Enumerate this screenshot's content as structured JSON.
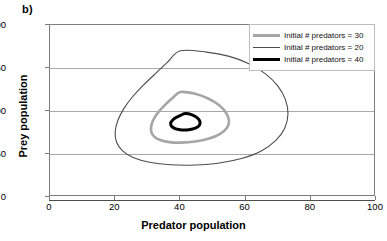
{
  "panel": {
    "label": "b)"
  },
  "chart_data": {
    "type": "line",
    "title": "",
    "xlabel": "Predator population",
    "ylabel": "Prey population",
    "xlim": [
      0,
      100
    ],
    "ylim": [
      0,
      200
    ],
    "xticks": [
      0,
      20,
      40,
      60,
      80,
      100
    ],
    "yticks": [
      0,
      50,
      100,
      150,
      200
    ],
    "grid": "horizontal",
    "legend_position": "top-right-inside",
    "series": [
      {
        "name": "Initial # predators = 30",
        "color": "#a6a6a6",
        "width": 2.6,
        "order": 1,
        "x_range": [
          31,
          55
        ],
        "y_range": [
          63,
          122
        ],
        "points": [
          [
            40.0,
            122.0
          ],
          [
            44.5,
            120.0
          ],
          [
            48.5,
            114.5
          ],
          [
            51.8,
            107.0
          ],
          [
            54.0,
            98.0
          ],
          [
            54.9,
            89.0
          ],
          [
            54.3,
            80.5
          ],
          [
            52.2,
            73.5
          ],
          [
            48.8,
            68.0
          ],
          [
            44.5,
            64.5
          ],
          [
            40.0,
            63.2
          ],
          [
            36.6,
            63.8
          ],
          [
            34.0,
            66.0
          ],
          [
            32.2,
            69.5
          ],
          [
            31.2,
            74.5
          ],
          [
            31.0,
            81.0
          ],
          [
            31.6,
            89.0
          ],
          [
            33.0,
            97.5
          ],
          [
            35.0,
            106.0
          ],
          [
            37.4,
            114.5
          ],
          [
            40.0,
            122.0
          ]
        ]
      },
      {
        "name": "Initial # predators = 20",
        "color": "#4d4d4d",
        "width": 1.1,
        "order": 2,
        "x_range": [
          20,
          73
        ],
        "y_range": [
          37,
          170
        ],
        "points": [
          [
            40.0,
            170.0
          ],
          [
            48.0,
            168.5
          ],
          [
            55.0,
            163.5
          ],
          [
            61.0,
            155.0
          ],
          [
            66.0,
            143.5
          ],
          [
            69.8,
            129.5
          ],
          [
            72.2,
            113.5
          ],
          [
            73.0,
            96.5
          ],
          [
            72.0,
            80.0
          ],
          [
            69.2,
            65.5
          ],
          [
            64.8,
            53.5
          ],
          [
            59.0,
            45.0
          ],
          [
            52.0,
            39.5
          ],
          [
            44.5,
            37.2
          ],
          [
            37.0,
            37.5
          ],
          [
            30.5,
            40.5
          ],
          [
            25.5,
            46.0
          ],
          [
            22.2,
            54.0
          ],
          [
            20.4,
            64.0
          ],
          [
            20.0,
            76.0
          ],
          [
            20.8,
            89.0
          ],
          [
            22.6,
            102.5
          ],
          [
            25.2,
            116.0
          ],
          [
            28.5,
            129.5
          ],
          [
            32.2,
            143.0
          ],
          [
            36.0,
            156.5
          ],
          [
            40.0,
            170.0
          ]
        ]
      },
      {
        "name": "Initial # predators = 40",
        "color": "#000000",
        "width": 3.0,
        "order": 3,
        "x_range": [
          37,
          46
        ],
        "y_range": [
          78,
          97
        ],
        "points": [
          [
            41.5,
            97.0
          ],
          [
            43.6,
            95.5
          ],
          [
            45.2,
            92.0
          ],
          [
            46.0,
            87.5
          ],
          [
            45.8,
            83.2
          ],
          [
            44.6,
            80.0
          ],
          [
            42.6,
            78.3
          ],
          [
            40.4,
            78.0
          ],
          [
            38.6,
            79.2
          ],
          [
            37.4,
            81.8
          ],
          [
            37.0,
            85.3
          ],
          [
            37.5,
            89.0
          ],
          [
            38.8,
            92.7
          ],
          [
            40.2,
            95.3
          ],
          [
            41.5,
            97.0
          ]
        ]
      }
    ]
  }
}
